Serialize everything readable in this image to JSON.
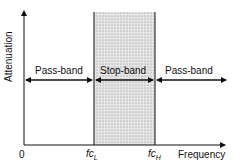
{
  "diagram": {
    "y_axis_label": "Attenuation",
    "x_axis_label": "Frequency",
    "origin_label": "0",
    "cutoffs": [
      {
        "symbol": "fc",
        "sub": "L"
      },
      {
        "symbol": "fc",
        "sub": "H"
      }
    ],
    "bands": [
      {
        "label": "Pass-band",
        "type": "pass"
      },
      {
        "label": "Stop-band",
        "type": "stop"
      },
      {
        "label": "Pass-band",
        "type": "pass"
      }
    ],
    "colors": {
      "line": "#111111",
      "stop_fill": "#d8d8d8"
    }
  }
}
